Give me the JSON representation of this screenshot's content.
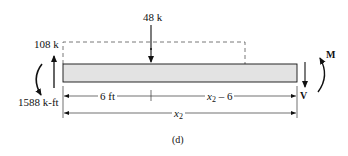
{
  "figure": {
    "caption": "(d)",
    "loads": {
      "point_load": "48 k",
      "left_reaction_force": "108 k",
      "left_reaction_moment": "1588 k-ft"
    },
    "internal": {
      "moment_label": "M",
      "shear_label": "V"
    },
    "dimensions": {
      "segment_1": "6 ft",
      "segment_2_var": "x",
      "segment_2_sub": "2",
      "segment_2_rest": " – 6",
      "total_var": "x",
      "total_sub": "2"
    },
    "colors": {
      "beam_fill": "#e3e3e3",
      "line": "#111111"
    }
  }
}
